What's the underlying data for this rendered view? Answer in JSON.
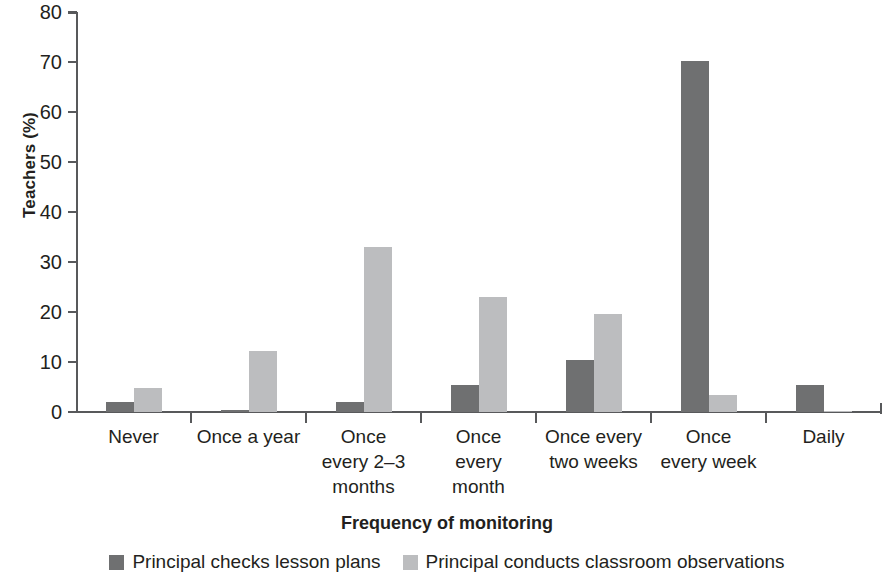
{
  "chart_data": {
    "type": "bar",
    "title": "",
    "xlabel": "Frequency of monitoring",
    "ylabel": "Teachers (%)",
    "ylim": [
      0,
      80
    ],
    "yticks": [
      0,
      10,
      20,
      30,
      40,
      50,
      60,
      70,
      80
    ],
    "grid": false,
    "legend_position": "bottom",
    "categories": [
      "Never",
      "Once every 2–3 months",
      "Once a year",
      "Once every month",
      "Once every two weeks",
      "Once every week",
      "Daily"
    ],
    "category_labels": [
      [
        "Never"
      ],
      [
        "Once a year"
      ],
      [
        "Once",
        "every 2–3",
        "months"
      ],
      [
        "Once",
        "every",
        "month"
      ],
      [
        "Once every",
        "two weeks"
      ],
      [
        "Once",
        "every week"
      ],
      [
        "Daily"
      ]
    ],
    "series": [
      {
        "name": "Principal checks lesson plans",
        "color": "#6f7071",
        "values": [
          2,
          0.5,
          2,
          5.5,
          10.5,
          70.2,
          5.5
        ]
      },
      {
        "name": "Principal conducts classroom observations",
        "color": "#bcbdbf",
        "values": [
          4.8,
          12.2,
          33,
          23,
          19.7,
          3.5,
          0.3
        ]
      }
    ]
  },
  "axis": {
    "y_tick_labels": [
      "0",
      "10",
      "20",
      "30",
      "40",
      "50",
      "60",
      "70",
      "80"
    ],
    "y_title": "Teachers (%)",
    "x_title": "Frequency of monitoring"
  },
  "legend": {
    "items": [
      {
        "label": "Principal checks lesson plans",
        "color": "#6f7071"
      },
      {
        "label": "Principal conducts classroom observations",
        "color": "#bcbdbf"
      }
    ]
  }
}
